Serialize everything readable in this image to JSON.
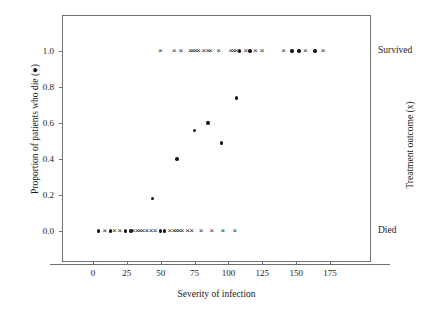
{
  "chart_data": {
    "type": "scatter",
    "title": "",
    "xlabel": "Severity of infection",
    "ylabel": "Proportion of patients who die (●)",
    "ylabel_right": "Treatment outcome (x)",
    "xlim": [
      -10,
      185
    ],
    "ylim": [
      -0.12,
      1.12
    ],
    "grid": false,
    "legend": "none",
    "xticks": [
      "0",
      "25",
      "50",
      "75",
      "100",
      "125",
      "150",
      "175"
    ],
    "xtick_values": [
      0,
      25,
      50,
      75,
      100,
      125,
      150,
      175
    ],
    "yticks": [
      "0.0",
      "0.2",
      "0.4",
      "0.6",
      "0.8",
      "1.0"
    ],
    "ytick_values": [
      0.0,
      0.2,
      0.4,
      0.6,
      0.8,
      1.0
    ],
    "right_axis_categories": [
      {
        "label": "Survived",
        "value": 1.0
      },
      {
        "label": "Died",
        "value": 0.0
      }
    ],
    "series": [
      {
        "name": "Proportion of patients who die",
        "marker": "circle",
        "symbol": "●",
        "color": "#1a1a1a",
        "points": [
          {
            "x": 44,
            "y": 0.18
          },
          {
            "x": 62,
            "y": 0.4
          },
          {
            "x": 75,
            "y": 0.56
          },
          {
            "x": 85,
            "y": 0.6
          },
          {
            "x": 95,
            "y": 0.49
          },
          {
            "x": 106,
            "y": 0.74
          }
        ]
      },
      {
        "name": "Treatment outcome - Survived (x)",
        "marker": "x",
        "symbol": "×",
        "color": "#1a1a1a",
        "points": [
          {
            "x": 50,
            "y": 1.0
          },
          {
            "x": 60,
            "y": 1.0
          },
          {
            "x": 65,
            "y": 1.0
          },
          {
            "x": 72,
            "y": 1.0
          },
          {
            "x": 74,
            "y": 1.0
          },
          {
            "x": 76,
            "y": 1.0
          },
          {
            "x": 78,
            "y": 1.0
          },
          {
            "x": 82,
            "y": 1.0
          },
          {
            "x": 85,
            "y": 1.0
          },
          {
            "x": 87,
            "y": 1.0
          },
          {
            "x": 93,
            "y": 1.0
          },
          {
            "x": 102,
            "y": 1.0
          },
          {
            "x": 104,
            "y": 1.0
          },
          {
            "x": 106,
            "y": 1.0
          },
          {
            "x": 113,
            "y": 1.0
          },
          {
            "x": 120,
            "y": 1.0
          },
          {
            "x": 125,
            "y": 1.0
          },
          {
            "x": 141,
            "y": 1.0
          },
          {
            "x": 157,
            "y": 1.0
          },
          {
            "x": 170,
            "y": 1.0
          }
        ]
      },
      {
        "name": "Treatment outcome - Survived (dot overlay)",
        "marker": "circle",
        "symbol": "●",
        "color": "#1a1a1a",
        "points": [
          {
            "x": 108,
            "y": 1.0
          },
          {
            "x": 116,
            "y": 1.0
          },
          {
            "x": 147,
            "y": 1.0
          },
          {
            "x": 152,
            "y": 1.0
          },
          {
            "x": 164,
            "y": 1.0
          }
        ]
      },
      {
        "name": "Treatment outcome - Died (x)",
        "marker": "x",
        "symbol": "×",
        "color": "#1a1a1a",
        "points": [
          {
            "x": 9,
            "y": 0.0
          },
          {
            "x": 16,
            "y": 0.0
          },
          {
            "x": 20,
            "y": 0.0
          },
          {
            "x": 30,
            "y": 0.0
          },
          {
            "x": 33,
            "y": 0.0
          },
          {
            "x": 35,
            "y": 0.0
          },
          {
            "x": 37,
            "y": 0.0
          },
          {
            "x": 40,
            "y": 0.0
          },
          {
            "x": 43,
            "y": 0.0
          },
          {
            "x": 46,
            "y": 0.0
          },
          {
            "x": 57,
            "y": 0.0
          },
          {
            "x": 60,
            "y": 0.0
          },
          {
            "x": 62,
            "y": 0.0
          },
          {
            "x": 64,
            "y": 0.0
          },
          {
            "x": 66,
            "y": 0.0
          },
          {
            "x": 70,
            "y": 0.0
          },
          {
            "x": 73,
            "y": 0.0
          },
          {
            "x": 80,
            "y": 0.0
          },
          {
            "x": 88,
            "y": 0.0
          },
          {
            "x": 96,
            "y": 0.0
          },
          {
            "x": 105,
            "y": 0.0
          }
        ]
      },
      {
        "name": "Treatment outcome - Died (dot overlay)",
        "marker": "circle",
        "symbol": "●",
        "color": "#1a1a1a",
        "points": [
          {
            "x": 4,
            "y": 0.0
          },
          {
            "x": 13,
            "y": 0.0
          },
          {
            "x": 24,
            "y": 0.0
          },
          {
            "x": 28,
            "y": 0.0
          },
          {
            "x": 50,
            "y": 0.0
          },
          {
            "x": 53,
            "y": 0.0
          }
        ]
      }
    ]
  }
}
